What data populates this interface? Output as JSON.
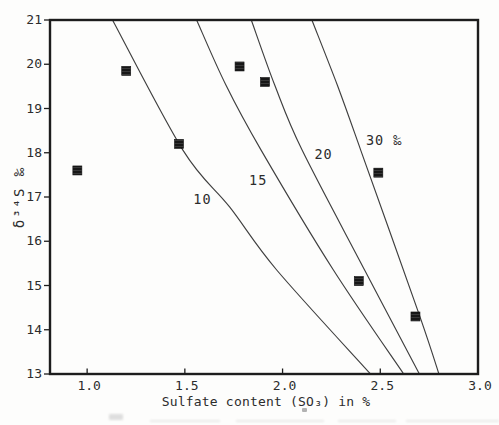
{
  "chart_data": {
    "type": "scatter",
    "title": "",
    "xlabel": "Sulfate content (SO₃) in %",
    "ylabel": "δ³⁴S ‰",
    "xlim": [
      0.81,
      3.0
    ],
    "ylim": [
      13,
      21
    ],
    "grid": false,
    "legend": null,
    "x_ticks": [
      {
        "value": 1.0,
        "label": "1.0"
      },
      {
        "value": 1.5,
        "label": "1.5"
      },
      {
        "value": 2.0,
        "label": "2.0"
      },
      {
        "value": 2.5,
        "label": "2.5"
      },
      {
        "value": 3.0,
        "label": "3.0"
      }
    ],
    "y_ticks": [
      {
        "value": 21,
        "label": "21"
      },
      {
        "value": 20,
        "label": "20"
      },
      {
        "value": 19,
        "label": "19"
      },
      {
        "value": 18,
        "label": "18"
      },
      {
        "value": 17,
        "label": "17"
      },
      {
        "value": 16,
        "label": "16"
      },
      {
        "value": 15,
        "label": "15"
      },
      {
        "value": 14,
        "label": "14"
      },
      {
        "value": 13,
        "label": "13"
      }
    ],
    "points": [
      [
        0.95,
        17.6
      ],
      [
        1.2,
        19.85
      ],
      [
        1.47,
        18.2
      ],
      [
        1.78,
        19.95
      ],
      [
        1.91,
        19.6
      ],
      [
        2.49,
        17.55
      ],
      [
        2.39,
        15.1
      ],
      [
        2.68,
        14.3
      ]
    ],
    "curves": [
      {
        "label": "10",
        "label_pos": [
          1.59,
          16.95
        ],
        "points": [
          [
            1.13,
            21.0
          ],
          [
            1.49,
            18.06
          ],
          [
            1.73,
            16.77
          ],
          [
            1.97,
            15.35
          ],
          [
            2.45,
            13.0
          ]
        ]
      },
      {
        "label": "15",
        "label_pos": [
          1.875,
          17.37
        ],
        "points": [
          [
            1.56,
            21.0
          ],
          [
            1.71,
            19.53
          ],
          [
            1.89,
            18.06
          ],
          [
            2.26,
            15.35
          ],
          [
            2.62,
            13.0
          ]
        ]
      },
      {
        "label": "20",
        "label_pos": [
          2.21,
          17.95
        ],
        "points": [
          [
            1.84,
            21.0
          ],
          [
            1.96,
            19.53
          ],
          [
            2.1,
            18.06
          ],
          [
            2.42,
            15.35
          ],
          [
            2.7,
            13.0
          ]
        ]
      },
      {
        "label": "30 ‰",
        "label_pos": [
          2.52,
          18.28
        ],
        "points": [
          [
            2.15,
            21.0
          ],
          [
            2.28,
            19.53
          ],
          [
            2.4,
            18.06
          ],
          [
            2.7,
            14.33
          ],
          [
            2.8,
            13.0
          ]
        ]
      }
    ],
    "marker": {
      "shape": "square",
      "size": 9,
      "color": "#171717"
    },
    "style": {
      "curve_color": "#3f3f3f",
      "frame_color": "#1d1d1d",
      "text_color": "#2c2c2c",
      "background": "#fdfdfc"
    }
  }
}
